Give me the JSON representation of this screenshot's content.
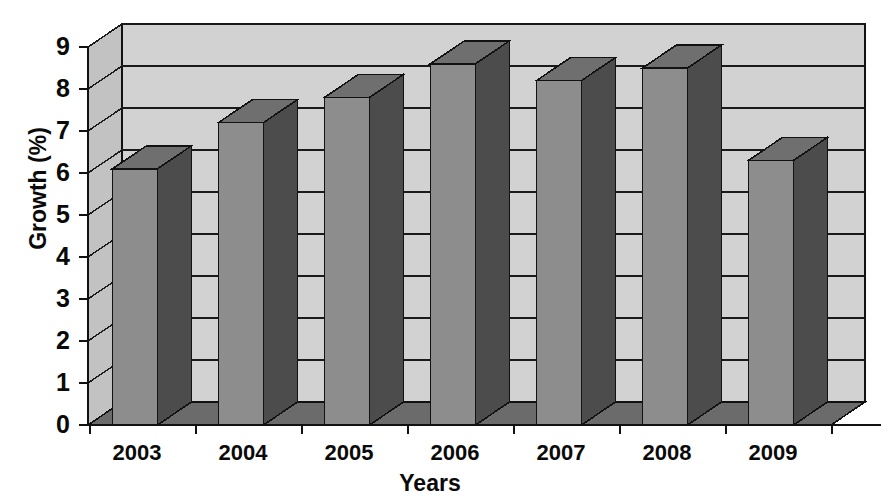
{
  "chart_data": {
    "type": "bar",
    "title": "",
    "subtitle": "",
    "xlabel": "Years",
    "ylabel": "Growth (%)",
    "categories": [
      "2003",
      "2004",
      "2005",
      "2006",
      "2007",
      "2008",
      "2009"
    ],
    "values": [
      6.1,
      7.2,
      7.8,
      8.6,
      8.2,
      8.5,
      6.3
    ],
    "ylim": [
      0,
      9
    ],
    "yticks": [
      0,
      1,
      2,
      3,
      4,
      5,
      6,
      7,
      8,
      9
    ],
    "ytick_labels": [
      "0",
      "1",
      "2",
      "3",
      "4",
      "5",
      "6",
      "7",
      "8",
      "9"
    ],
    "grid": true,
    "grid_axis": "y",
    "legend": false,
    "legend_position": "none",
    "style": "3d-column",
    "series": [
      {
        "name": "Growth",
        "values": [
          6.1,
          7.2,
          7.8,
          8.6,
          8.2,
          8.5,
          6.3
        ]
      }
    ],
    "annotations": []
  },
  "colors": {
    "bar_front": "#8d8d8d",
    "bar_side": "#4c4c4c",
    "bar_top": "#6f6f6f",
    "bar_outline": "#121212",
    "wall_back": "#d2d2d2",
    "wall_left": "#c2c2c2",
    "floor": "#6b6b6b",
    "floor_left": "#4a4a4a",
    "gridline": "#1a1a1a",
    "axis": "#111111",
    "text": "#0a0a0a",
    "background": "#ffffff"
  },
  "geometry": {
    "plot_left": 88,
    "plot_right": 831,
    "plot_bottom": 425,
    "plot_top": 47,
    "depth_x": 34,
    "depth_y": 23,
    "bar_width": 45,
    "bar_slot": 106,
    "bar_first_center": 135
  },
  "icons": {
    "none": ""
  }
}
